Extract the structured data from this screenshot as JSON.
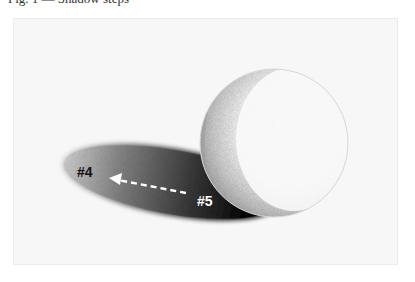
{
  "caption": "Fig. 1 — Shadow steps",
  "illustration": {
    "subject": "pencil-shaded sphere with cast shadow",
    "background_color": "#f7f7f7",
    "sphere_highlight_color": "#fbfbfb",
    "sphere_core_shadow_color": "#a9a9a9",
    "cast_shadow_dark_color": "#0e0e0e",
    "cast_shadow_light_color": "#9a9a9a"
  },
  "annotations": {
    "label_4": "#4",
    "label_5": "#5",
    "arrow": {
      "style": "dashed",
      "color": "#ffffff",
      "direction": "from #5 toward #4"
    }
  }
}
